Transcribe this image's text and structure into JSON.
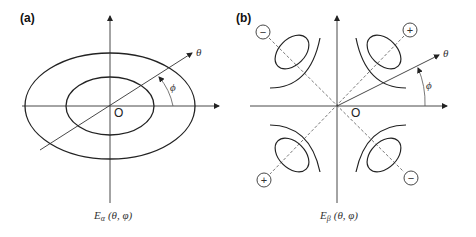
{
  "figure": {
    "panels": [
      {
        "label": "(a)",
        "origin_label": "O",
        "theta_label": "θ",
        "phi_label": "ϕ",
        "caption": {
          "E": "E",
          "sub": "α",
          "args": "(θ, φ)"
        }
      },
      {
        "label": "(b)",
        "origin_label": "O",
        "theta_label": "θ",
        "phi_label": "ϕ",
        "caption": {
          "E": "E",
          "sub": "β",
          "args": "(θ, φ)"
        },
        "lobe_signs": {
          "top_left": "−",
          "top_right": "+",
          "bottom_left": "+",
          "bottom_right": "−"
        }
      }
    ],
    "colors": {
      "stroke": "#222222",
      "axis": "#333333",
      "dashed": "#555555"
    }
  }
}
